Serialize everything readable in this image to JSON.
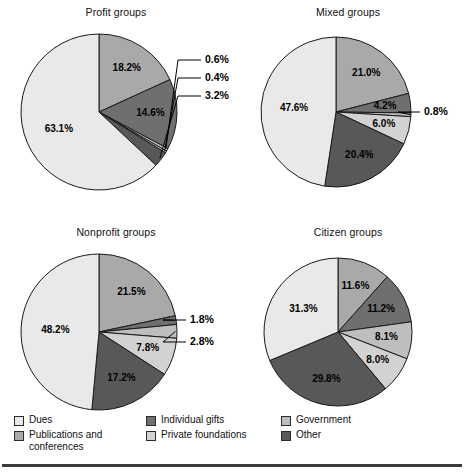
{
  "figure": {
    "background": "#ffffff",
    "rule_color": "#3a3a3a"
  },
  "categories": [
    {
      "key": "dues",
      "label": "Dues",
      "color": "#e9e9e9"
    },
    {
      "key": "publications",
      "label": "Publications and\nconferences",
      "color": "#a9a9a9"
    },
    {
      "key": "gifts",
      "label": "Individual gifts",
      "color": "#6f6f6f"
    },
    {
      "key": "foundations",
      "label": "Private foundations",
      "color": "#d2d2d2"
    },
    {
      "key": "government",
      "label": "Government",
      "color": "#bebebe"
    },
    {
      "key": "other",
      "label": "Other",
      "color": "#585858"
    }
  ],
  "legend": {
    "columns": [
      {
        "items": [
          {
            "label": "Dues",
            "color": "#e9e9e9"
          },
          {
            "label": "Publications and\nconferences",
            "color": "#a9a9a9"
          }
        ]
      },
      {
        "items": [
          {
            "label": "Individual gifts",
            "color": "#6f6f6f"
          },
          {
            "label": "Private foundations",
            "color": "#d2d2d2"
          }
        ]
      },
      {
        "items": [
          {
            "label": "Government",
            "color": "#bebebe"
          },
          {
            "label": "Other",
            "color": "#585858"
          }
        ]
      }
    ]
  },
  "chart_data": [
    {
      "type": "pie",
      "title": "Profit groups",
      "categories": [
        "Publications and conferences",
        "Individual gifts",
        "Government",
        "Private foundations",
        "Other",
        "Dues"
      ],
      "values": [
        18.2,
        14.6,
        0.6,
        0.4,
        3.2,
        63.1
      ],
      "labels": [
        "18.2%",
        "14.6%",
        "0.6%",
        "0.4%",
        "3.2%",
        "63.1%"
      ],
      "colors": [
        "#a9a9a9",
        "#6f6f6f",
        "#bebebe",
        "#d2d2d2",
        "#585858",
        "#e9e9e9"
      ],
      "label_placement": [
        "inside",
        "inside",
        "outside",
        "outside",
        "outside",
        "inside"
      ],
      "units": "percent",
      "start_angle_deg": 0,
      "direction": "clockwise"
    },
    {
      "type": "pie",
      "title": "Mixed groups",
      "categories": [
        "Publications and conferences",
        "Individual gifts",
        "Government",
        "Private foundations",
        "Other",
        "Dues"
      ],
      "values": [
        21.0,
        4.2,
        0.8,
        6.0,
        20.4,
        47.6
      ],
      "labels": [
        "21.0%",
        "4.2%",
        "0.8%",
        "6.0%",
        "20.4%",
        "47.6%"
      ],
      "colors": [
        "#a9a9a9",
        "#6f6f6f",
        "#bebebe",
        "#d2d2d2",
        "#585858",
        "#e9e9e9"
      ],
      "label_placement": [
        "inside",
        "inside",
        "outside",
        "inside",
        "inside",
        "inside"
      ],
      "units": "percent",
      "start_angle_deg": 0,
      "direction": "clockwise"
    },
    {
      "type": "pie",
      "title": "Nonprofit groups",
      "categories": [
        "Publications and conferences",
        "Individual gifts",
        "Government",
        "Private foundations",
        "Other",
        "Dues"
      ],
      "values": [
        21.5,
        1.8,
        2.8,
        7.8,
        17.2,
        48.2
      ],
      "labels": [
        "21.5%",
        "1.8%",
        "2.8%",
        "7.8%",
        "17.2%",
        "48.2%"
      ],
      "colors": [
        "#a9a9a9",
        "#6f6f6f",
        "#bebebe",
        "#d2d2d2",
        "#585858",
        "#e9e9e9"
      ],
      "label_placement": [
        "inside",
        "outside",
        "outside",
        "inside",
        "inside",
        "inside"
      ],
      "units": "percent",
      "start_angle_deg": 0,
      "direction": "clockwise"
    },
    {
      "type": "pie",
      "title": "Citizen groups",
      "categories": [
        "Publications and conferences",
        "Individual gifts",
        "Government",
        "Private foundations",
        "Other",
        "Dues"
      ],
      "values": [
        11.6,
        11.2,
        8.1,
        8.0,
        29.8,
        31.3
      ],
      "labels": [
        "11.6%",
        "11.2%",
        "8.1%",
        "8.0%",
        "29.8%",
        "31.3%"
      ],
      "colors": [
        "#a9a9a9",
        "#6f6f6f",
        "#bebebe",
        "#d2d2d2",
        "#585858",
        "#e9e9e9"
      ],
      "label_placement": [
        "inside",
        "inside",
        "inside",
        "inside",
        "inside",
        "inside"
      ],
      "units": "percent",
      "start_angle_deg": 0,
      "direction": "clockwise"
    }
  ],
  "panels": [
    {
      "name": "profit",
      "cx": 99,
      "cy": 112,
      "r": 78,
      "title_x": 99,
      "title_y": 13
    },
    {
      "name": "mixed",
      "cx": 336,
      "cy": 112,
      "r": 75,
      "title_x": 336,
      "title_y": 13
    },
    {
      "name": "nonprofit",
      "cx": 99,
      "cy": 332,
      "r": 78,
      "title_x": 99,
      "title_y": 232
    },
    {
      "name": "citizen",
      "cx": 338,
      "cy": 332,
      "r": 74,
      "title_x": 338,
      "title_y": 232
    }
  ]
}
